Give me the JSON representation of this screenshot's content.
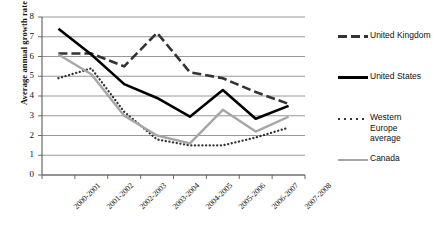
{
  "chart_data": {
    "type": "line",
    "title": "",
    "xlabel": "",
    "ylabel": "Average annual growth rate",
    "ylim": [
      0,
      8
    ],
    "ytick_step": 1,
    "grid": "horizontal",
    "legend_position": "right",
    "categories": [
      "2000-2001",
      "2001-2002",
      "2002-2003",
      "2003-2004",
      "2004-2005",
      "2005-2006",
      "2006-2007",
      "2007-2008"
    ],
    "yticks": [
      "0",
      "1",
      "2",
      "3",
      "4",
      "5",
      "6",
      "7",
      "8"
    ],
    "series": [
      {
        "name": "United Kingdom",
        "style": "dashed",
        "color": "#333333",
        "values": [
          6.15,
          6.15,
          5.5,
          7.2,
          5.2,
          4.9,
          4.2,
          3.6
        ]
      },
      {
        "name": "United States",
        "style": "solid",
        "color": "#000000",
        "values": [
          7.4,
          6.1,
          4.6,
          3.9,
          2.95,
          4.3,
          2.85,
          3.5
        ]
      },
      {
        "name": "Western Europe average",
        "style": "dotted",
        "color": "#333333",
        "values": [
          4.9,
          5.4,
          3.2,
          1.8,
          1.5,
          1.5,
          1.9,
          2.4
        ]
      },
      {
        "name": "Canada",
        "style": "solid",
        "color": "#a6a6a6",
        "values": [
          6.1,
          5.1,
          3.0,
          2.0,
          1.6,
          3.3,
          2.2,
          2.95
        ]
      }
    ]
  },
  "legend": {
    "items": [
      {
        "label": "United Kingdom",
        "key": "dashed-line-key"
      },
      {
        "label": "United States",
        "key": "solid-black-line-key"
      },
      {
        "label": "Western Europe average",
        "key": "dotted-line-key"
      },
      {
        "label": "Canada",
        "key": "solid-gray-line-key"
      }
    ]
  }
}
